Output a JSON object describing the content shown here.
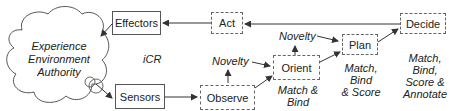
{
  "diagram": {
    "cloud": {
      "lines": [
        "Experience",
        "Environment",
        "Authority"
      ]
    },
    "center_label": "iCR",
    "boxes": {
      "effectors": "Effectors",
      "sensors": "Sensors",
      "act": "Act",
      "observe": "Observe",
      "orient": "Orient",
      "plan": "Plan",
      "decide": "Decide"
    },
    "annotations": {
      "novelty_observe": "Novelty",
      "novelty_orient": "Novelty",
      "orient_desc": [
        "Match &",
        "Bind"
      ],
      "plan_desc": [
        "Match,",
        "Bind",
        "& Score"
      ],
      "decide_desc": [
        "Match,",
        "Bind,",
        "Score &",
        "Annotate"
      ]
    },
    "colors": {
      "line": "#444444",
      "text": "#222222",
      "background": "#ffffff"
    }
  }
}
